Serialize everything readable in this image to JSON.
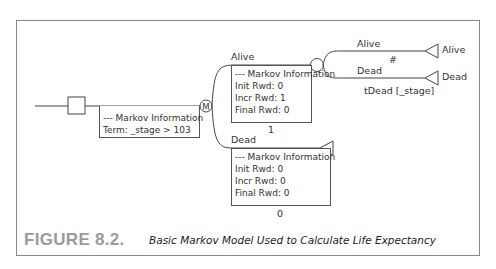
{
  "figure": {
    "number": "FIGURE 8.2.",
    "caption": "Basic Markov Model Used to Calculate Life Expectancy"
  },
  "root": {
    "markov_node_label": "M",
    "info_title": "--- Markov Information",
    "term": "Term: _stage > 103"
  },
  "states": [
    {
      "name": "Alive",
      "info_title": "--- Markov Information",
      "init": "Init Rwd: 0",
      "incr": "Incr Rwd: 1",
      "final": "Final Rwd: 0",
      "value": "1"
    },
    {
      "name": "Dead",
      "info_title": "--- Markov Information",
      "init": "Init Rwd: 0",
      "incr": "Incr Rwd: 0",
      "final": "Final Rwd: 0",
      "value": "0"
    }
  ],
  "chance": {
    "branches": [
      {
        "label": "Alive",
        "prob": "#",
        "terminal": "Alive"
      },
      {
        "label": "Dead",
        "prob": "tDead [_stage]",
        "terminal": "Dead"
      }
    ]
  }
}
